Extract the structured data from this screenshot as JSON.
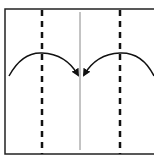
{
  "diagram": {
    "type": "fold-instruction",
    "colors": {
      "line": "#111111",
      "center_line": "#888888",
      "background": "#ffffff"
    },
    "elements": {
      "frame": "paper-sheet",
      "left_fold_line": "dashed",
      "right_fold_line": "dashed",
      "center_line": "solid-thin",
      "left_arrow": "curved arrow pointing right to center",
      "right_arrow": "curved arrow pointing left to center"
    }
  }
}
